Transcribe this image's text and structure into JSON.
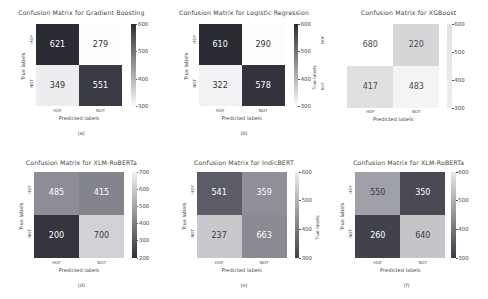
{
  "figure": {
    "xlabel": "Predicted labels",
    "ylabel": "True labels",
    "classes": [
      "HOF",
      "NOT"
    ],
    "dark": "#2f2f3a",
    "light": "#e8e8ea",
    "mid": "#9a9aa2"
  },
  "chart_data": [
    {
      "type": "heatmap",
      "panel": "a",
      "caption": "(a)",
      "title": "Confusion Matrix for Gradient Boosting",
      "xlabel": "Predicted labels",
      "ylabel": "True labels",
      "categories": [
        "HOF",
        "NOT"
      ],
      "matrix": [
        [
          621,
          279
        ],
        [
          349,
          551
        ]
      ],
      "cells": {
        "tl": 621,
        "tr": 279,
        "bl": 349,
        "br": 551
      },
      "cell_colors": {
        "tl": "#2b2b33",
        "tr": "#fdfdfd",
        "bl": "#ededef",
        "br": "#3a3a44"
      },
      "cell_text_colors": {
        "tl": "#ffffff",
        "tr": "#333333",
        "bl": "#333333",
        "br": "#ffffff"
      },
      "colorbar": {
        "ticks": [
          600,
          500,
          400,
          300
        ],
        "vmin": 300,
        "vmax": 600,
        "top_color": "#2b2b33",
        "bottom_color": "#fbfbfc"
      },
      "grid": false,
      "legend": "none"
    },
    {
      "type": "heatmap",
      "panel": "b",
      "caption": "(b)",
      "title": "Confusion Matrix for Logistic Regression",
      "xlabel": "Predicted labels",
      "ylabel": "True labels",
      "categories": [
        "HOF",
        "NOT"
      ],
      "matrix": [
        [
          610,
          290
        ],
        [
          322,
          578
        ]
      ],
      "cells": {
        "tl": 610,
        "tr": 290,
        "bl": 322,
        "br": 578
      },
      "cell_colors": {
        "tl": "#2b2b33",
        "tr": "#fdfdfd",
        "bl": "#f2f2f4",
        "br": "#33333d"
      },
      "cell_text_colors": {
        "tl": "#ffffff",
        "tr": "#333333",
        "bl": "#333333",
        "br": "#ffffff"
      },
      "colorbar": {
        "ticks": [
          600,
          500,
          400,
          300
        ],
        "vmin": 300,
        "vmax": 600,
        "top_color": "#2b2b33",
        "bottom_color": "#fbfbfc"
      },
      "grid": false,
      "legend": "none"
    },
    {
      "type": "heatmap",
      "panel": "c",
      "caption": "",
      "title": "Confusion Matrix for XGBoost",
      "xlabel": "Predicted labels",
      "ylabel": "True labels",
      "categories": [
        "HOF",
        "NOT"
      ],
      "matrix": [
        [
          680,
          220
        ],
        [
          417,
          483
        ]
      ],
      "cells": {
        "tl": 680,
        "tr": 220,
        "bl": 417,
        "br": 483
      },
      "cell_colors": {
        "tl": "#ffffff",
        "tr": "#d6d6d8",
        "bl": "#e0e0e2",
        "br": "#f4f4f5"
      },
      "cell_text_colors": {
        "tl": "#4a4a4a",
        "tr": "#4a4a4a",
        "bl": "#4a4a4a",
        "br": "#4a4a4a"
      },
      "colorbar": {
        "ticks": [
          600,
          500,
          400,
          300
        ],
        "vmin": 300,
        "vmax": 600,
        "top_color": "#e2e2e4",
        "bottom_color": "#ededef"
      },
      "grid": false,
      "legend": "none"
    },
    {
      "type": "heatmap",
      "panel": "d",
      "caption": "(d)",
      "title": "Confusion Matrix for XLM-RoBERTa",
      "xlabel": "Predicted labels",
      "ylabel": "True labels",
      "categories": [
        "HOF",
        "NOT"
      ],
      "matrix": [
        [
          485,
          415
        ],
        [
          200,
          700
        ]
      ],
      "cells": {
        "tl": 485,
        "tr": 415,
        "bl": 200,
        "br": 700
      },
      "cell_colors": {
        "tl": "#8d8d95",
        "tr": "#84848c",
        "bl": "#35353f",
        "br": "#d2d2d6"
      },
      "cell_text_colors": {
        "tl": "#ffffff",
        "tr": "#ffffff",
        "bl": "#ffffff",
        "br": "#3a3a3a"
      },
      "colorbar": {
        "ticks": [
          700,
          600,
          500,
          400,
          300,
          200
        ],
        "vmin": 200,
        "vmax": 700,
        "top_color": "#f2f2f4",
        "bottom_color": "#2f2f39"
      },
      "grid": false,
      "legend": "none"
    },
    {
      "type": "heatmap",
      "panel": "e",
      "caption": "(e)",
      "title": "Confusion Matrix for IndicBERT",
      "xlabel": "Predicted labels",
      "ylabel": "True labels",
      "categories": [
        "HOF",
        "NOT"
      ],
      "matrix": [
        [
          541,
          359
        ],
        [
          237,
          663
        ]
      ],
      "cells": {
        "tl": 541,
        "tr": 359,
        "bl": 237,
        "br": 663
      },
      "cell_colors": {
        "tl": "#5c5c66",
        "tr": "#8f8f97",
        "bl": "#c9c9cd",
        "br": "#8a8a92"
      },
      "cell_text_colors": {
        "tl": "#ffffff",
        "tr": "#ffffff",
        "bl": "#3a3a3a",
        "br": "#ffffff"
      },
      "colorbar": {
        "ticks": [
          600,
          500,
          400,
          300
        ],
        "vmin": 300,
        "vmax": 600,
        "top_color": "#ededef",
        "bottom_color": "#3f3f49"
      },
      "grid": false,
      "legend": "none"
    },
    {
      "type": "heatmap",
      "panel": "f",
      "caption": "(f)",
      "title": "Confusion Matrix for XLM-RoBERTa",
      "xlabel": "Predicted labels",
      "ylabel": "True labels",
      "categories": [
        "HOF",
        "NOT"
      ],
      "matrix": [
        [
          550,
          350
        ],
        [
          260,
          640
        ]
      ],
      "cells": {
        "tl": 550,
        "tr": 350,
        "bl": 260,
        "br": 640
      },
      "cell_colors": {
        "tl": "#a0a0a8",
        "tr": "#4a4a54",
        "bl": "#42424c",
        "br": "#c4c4c9"
      },
      "cell_text_colors": {
        "tl": "#3a3a3a",
        "tr": "#ffffff",
        "bl": "#ffffff",
        "br": "#3a3a3a"
      },
      "colorbar": {
        "ticks": [
          600,
          500,
          400,
          300
        ],
        "vmin": 300,
        "vmax": 600,
        "top_color": "#e8e8ea",
        "bottom_color": "#3a3a44"
      },
      "grid": false,
      "legend": "none"
    }
  ],
  "captions": {
    "a": "(a)",
    "b": "(b)",
    "d": "(d)",
    "e": "(e)",
    "f": "(f)"
  },
  "side_labels": {
    "b_right_ylabel": "True labels",
    "b_right_tick_top": "HOF",
    "b_right_tick_bottom": "NOT",
    "e_right_ylabel": "True labels"
  }
}
